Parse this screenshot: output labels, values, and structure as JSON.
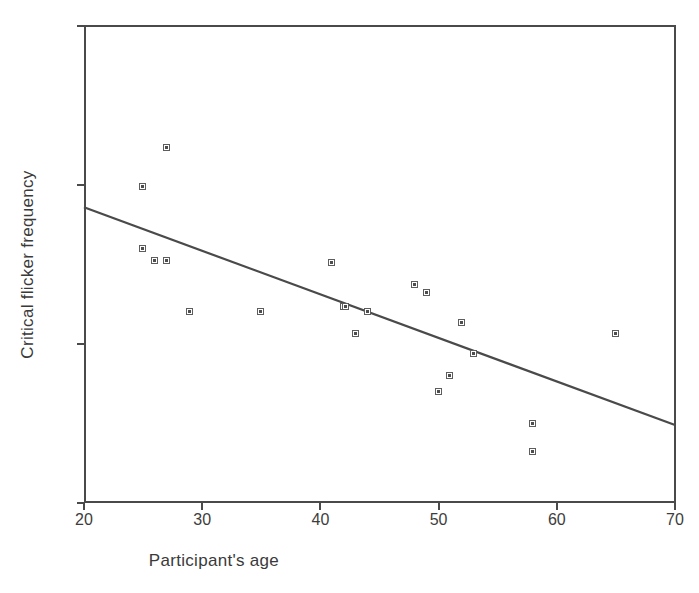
{
  "chart_data": {
    "type": "scatter",
    "title": "",
    "xlabel": "Participant's age",
    "ylabel": "Critical flicker frequency",
    "xlim": [
      20,
      70
    ],
    "ylim": [
      20,
      50
    ],
    "xticks": [
      20,
      30,
      40,
      50,
      60,
      70
    ],
    "yticks": [
      20,
      30,
      40,
      50
    ],
    "grid": false,
    "legend": null,
    "marker": "open-square",
    "marker_color": "#5d5d5d",
    "line_color": "#4a4a4a",
    "x": [
      25,
      25,
      26,
      27,
      27,
      29,
      35,
      41,
      42,
      42,
      43,
      44,
      48,
      49,
      50,
      51,
      52,
      53,
      58,
      58,
      65
    ],
    "y": [
      39.9,
      36.0,
      35.2,
      42.3,
      35.2,
      32.0,
      32.0,
      35.1,
      32.3,
      32.3,
      30.6,
      32.0,
      33.7,
      33.2,
      27.0,
      28.0,
      31.3,
      29.4,
      25.0,
      23.2,
      30.6
    ],
    "points": [
      {
        "x": 25,
        "y": 39.9
      },
      {
        "x": 25,
        "y": 36.0
      },
      {
        "x": 26,
        "y": 35.2
      },
      {
        "x": 27,
        "y": 42.3
      },
      {
        "x": 27,
        "y": 35.2
      },
      {
        "x": 29,
        "y": 32.0
      },
      {
        "x": 35,
        "y": 32.0
      },
      {
        "x": 41,
        "y": 35.1
      },
      {
        "x": 42,
        "y": 32.3
      },
      {
        "x": 42.2,
        "y": 32.3
      },
      {
        "x": 43,
        "y": 30.6
      },
      {
        "x": 44,
        "y": 32.0
      },
      {
        "x": 48,
        "y": 33.7
      },
      {
        "x": 49,
        "y": 33.2
      },
      {
        "x": 50,
        "y": 27.0
      },
      {
        "x": 51,
        "y": 28.0
      },
      {
        "x": 52,
        "y": 31.3
      },
      {
        "x": 53,
        "y": 29.4
      },
      {
        "x": 58,
        "y": 25.0
      },
      {
        "x": 58,
        "y": 23.2
      },
      {
        "x": 65,
        "y": 30.6
      }
    ],
    "trendline": {
      "type": "linear-fit",
      "x_start": 20,
      "y_start": 38.6,
      "x_end": 70,
      "y_end": 24.9
    }
  },
  "axes": {
    "x_tick_labels": [
      "20",
      "30",
      "40",
      "50",
      "60",
      "70"
    ],
    "y_tick_labels": [
      "50",
      "40",
      "30",
      "20"
    ],
    "x_title": "Participant's age",
    "y_title": "Critical flicker frequency"
  }
}
